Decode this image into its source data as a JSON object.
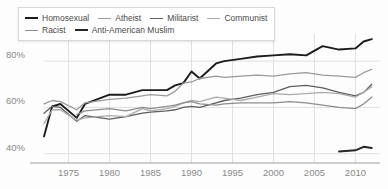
{
  "chart_data": {
    "type": "line",
    "title": "",
    "xlabel": "",
    "ylabel": "",
    "xlim": [
      1972,
      2013
    ],
    "ylim": [
      36,
      90
    ],
    "grid": true,
    "legend_position": "top-left",
    "xticks": [
      1975,
      1980,
      1985,
      1990,
      1995,
      2000,
      2005,
      2010
    ],
    "xtick_labels": [
      "1975",
      "1980",
      "1985",
      "1990",
      "1995",
      "2000",
      "2005",
      "2010"
    ],
    "yticks": [
      40,
      60,
      80
    ],
    "ytick_labels": [
      "40%",
      "60%",
      "80%"
    ],
    "series": [
      {
        "name": "Homosexual",
        "color": "#1c1c1c",
        "width": 1.9,
        "x": [
          1972,
          1973,
          1974,
          1976,
          1977,
          1980,
          1982,
          1984,
          1985,
          1987,
          1988,
          1989,
          1990,
          1991,
          1993,
          1994,
          1996,
          1998,
          2000,
          2002,
          2004,
          2006,
          2008,
          2010,
          2011,
          2012
        ],
        "y": [
          47.5,
          60.5,
          61.5,
          55.5,
          61.5,
          65.5,
          65.5,
          67.5,
          67.5,
          67.5,
          69.5,
          70.5,
          75.5,
          72.5,
          79.0,
          80.0,
          81.0,
          82.0,
          82.5,
          83.0,
          82.5,
          86.5,
          85.0,
          85.5,
          88.5,
          89.5
        ]
      },
      {
        "name": "Atheist",
        "color": "#9a9a9a",
        "width": 1.3,
        "x": [
          1972,
          1973,
          1974,
          1976,
          1977,
          1980,
          1982,
          1984,
          1985,
          1987,
          1988,
          1989,
          1990,
          1991,
          1993,
          1994,
          1996,
          1998,
          2000,
          2002,
          2004,
          2006,
          2008,
          2010,
          2011,
          2012
        ],
        "y": [
          61.5,
          63.0,
          62.5,
          59.0,
          62.0,
          63.5,
          64.0,
          65.0,
          65.5,
          65.0,
          67.0,
          70.5,
          71.0,
          72.5,
          73.5,
          73.0,
          73.5,
          74.0,
          73.5,
          74.5,
          75.0,
          74.0,
          73.5,
          73.0,
          75.0,
          76.5
        ]
      },
      {
        "name": "Militarist",
        "color": "#5e5e5e",
        "width": 1.3,
        "x": [
          1972,
          1973,
          1974,
          1976,
          1977,
          1980,
          1982,
          1984,
          1985,
          1987,
          1988,
          1989,
          1990,
          1991,
          1993,
          1994,
          1996,
          1998,
          2000,
          2002,
          2004,
          2006,
          2008,
          2010,
          2011,
          2012
        ],
        "y": [
          57.5,
          60.5,
          60.0,
          54.0,
          56.5,
          55.0,
          56.0,
          57.5,
          58.0,
          58.5,
          59.0,
          60.0,
          60.5,
          60.0,
          62.0,
          63.0,
          64.0,
          65.5,
          66.5,
          69.0,
          69.5,
          68.5,
          66.5,
          65.0,
          66.5,
          70.0
        ]
      },
      {
        "name": "Communist",
        "color": "#ababab",
        "width": 1.3,
        "x": [
          1972,
          1973,
          1974,
          1976,
          1977,
          1980,
          1982,
          1984,
          1985,
          1987,
          1988,
          1989,
          1990,
          1991,
          1993,
          1994,
          1996,
          1998,
          2000,
          2002,
          2004,
          2006,
          2008,
          2010,
          2011,
          2012
        ],
        "y": [
          53.0,
          59.0,
          59.0,
          54.5,
          55.5,
          56.5,
          56.0,
          59.5,
          58.5,
          59.5,
          60.5,
          62.0,
          63.0,
          62.5,
          64.5,
          64.0,
          63.0,
          64.5,
          66.0,
          65.5,
          66.0,
          66.5,
          66.0,
          64.5,
          66.5,
          69.0
        ]
      },
      {
        "name": "Racist",
        "color": "#8d8d8d",
        "width": 1.3,
        "x": [
          1976,
          1977,
          1980,
          1982,
          1984,
          1985,
          1987,
          1988,
          1989,
          1990,
          1991,
          1993,
          1994,
          1996,
          1998,
          2000,
          2002,
          2004,
          2006,
          2008,
          2010,
          2011,
          2012
        ],
        "y": [
          57.0,
          58.5,
          59.5,
          58.5,
          60.0,
          59.5,
          60.5,
          61.0,
          62.0,
          62.5,
          61.5,
          61.0,
          61.5,
          62.0,
          62.0,
          62.0,
          62.5,
          62.0,
          61.0,
          60.0,
          59.5,
          61.5,
          64.5
        ]
      },
      {
        "name": "Anti-American Muslim",
        "color": "#262626",
        "width": 1.9,
        "x": [
          2008,
          2010,
          2011,
          2012
        ],
        "y": [
          41.0,
          41.5,
          43.0,
          42.5
        ]
      }
    ]
  },
  "legend": {
    "rows": [
      [
        {
          "label": "Homosexual",
          "color": "#1c1c1c",
          "width": 2.2
        },
        {
          "label": "Atheist",
          "color": "#9a9a9a",
          "width": 1.6
        },
        {
          "label": "Militarist",
          "color": "#5e5e5e",
          "width": 1.6
        },
        {
          "label": "Communist",
          "color": "#ababab",
          "width": 1.6
        }
      ],
      [
        {
          "label": "Racist",
          "color": "#8d8d8d",
          "width": 1.6
        },
        {
          "label": "Anti-American Muslim",
          "color": "#262626",
          "width": 2.2
        }
      ]
    ]
  },
  "style": {
    "background": "#fdfdfd",
    "grid_color": "#dcdcdc",
    "axis_color": "#9e9e9e",
    "tick_text_color": "#8a8a8a"
  }
}
